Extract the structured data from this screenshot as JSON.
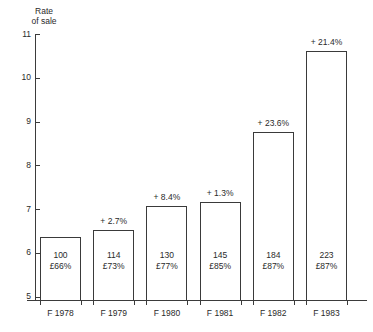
{
  "chart_data": {
    "type": "bar",
    "title": "",
    "ylabel": "Rate\nof sale",
    "ylabel_line1": "Rate",
    "ylabel_line2": "of sale",
    "xlabel": "",
    "ylim": [
      5,
      11
    ],
    "ytick_labels": [
      "11",
      "10",
      "9",
      "8",
      "7",
      "6",
      "5"
    ],
    "ytick_values": [
      11,
      10,
      9,
      8,
      7,
      6,
      5
    ],
    "grid": false,
    "legend": "none",
    "categories": [
      "F 1978",
      "F 1979",
      "F 1980",
      "F 1981",
      "F 1982",
      "F 1983"
    ],
    "values": [
      6.35,
      6.52,
      7.07,
      7.16,
      8.75,
      10.62
    ],
    "bar_style": "outline",
    "annotations_above": [
      "",
      "+ 2.7%",
      "+ 8.4%",
      "+ 1.3%",
      "+ 23.6%",
      "+ 21.4%"
    ],
    "labels_inside_line1": [
      "100",
      "114",
      "130",
      "145",
      "184",
      "223"
    ],
    "labels_inside_line2": [
      "£66%",
      "£73%",
      "£77%",
      "£85%",
      "£87%",
      "£87%"
    ]
  },
  "chart": {
    "axis_title_line1": "Rate",
    "axis_title_line2": "of sale",
    "yticks": [
      {
        "label": "11",
        "value": 11
      },
      {
        "label": "10",
        "value": 10
      },
      {
        "label": "9",
        "value": 9
      },
      {
        "label": "8",
        "value": 8
      },
      {
        "label": "7",
        "value": 7
      },
      {
        "label": "6",
        "value": 6
      },
      {
        "label": "5",
        "value": 5
      }
    ],
    "bars": [
      {
        "category": "F 1978",
        "value": 6.35,
        "index_label": "100",
        "price_label": "£66%",
        "growth": ""
      },
      {
        "category": "F 1979",
        "value": 6.52,
        "index_label": "114",
        "price_label": "£73%",
        "growth": "+ 2.7%"
      },
      {
        "category": "F 1980",
        "value": 7.07,
        "index_label": "130",
        "price_label": "£77%",
        "growth": "+ 8.4%"
      },
      {
        "category": "F 1981",
        "value": 7.16,
        "index_label": "145",
        "price_label": "£85%",
        "growth": "+ 1.3%"
      },
      {
        "category": "F 1982",
        "value": 8.75,
        "index_label": "184",
        "price_label": "£87%",
        "growth": "+ 23.6%"
      },
      {
        "category": "F 1983",
        "value": 10.62,
        "index_label": "223",
        "price_label": "£87%",
        "growth": "+ 21.4%"
      }
    ],
    "colors": {
      "ink": "#2a2a2a",
      "axis": "#3b3b3b",
      "bar_stroke": "#3a3a3a",
      "bar_fill": "#ffffff",
      "background": "#ffffff"
    }
  }
}
